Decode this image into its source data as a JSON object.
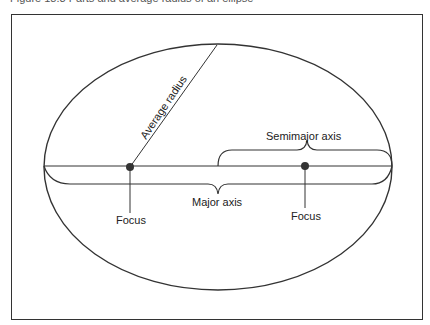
{
  "caption": "Figure 18.3   Parts and average radius of an ellipse",
  "labels": {
    "average_radius": "Average radius",
    "semimajor_axis": "Semimajor axis",
    "major_axis": "Major axis",
    "focus_left": "Focus",
    "focus_right": "Focus"
  },
  "colors": {
    "ink": "#333333",
    "background": "#ffffff"
  }
}
